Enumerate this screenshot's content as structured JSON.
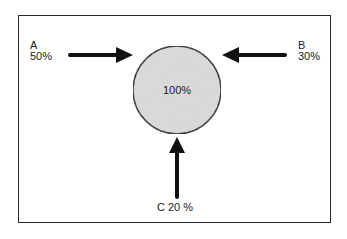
{
  "diagram": {
    "type": "flow-merge",
    "center": {
      "label": "100%",
      "fill": "#dcdcdc",
      "stroke": "#1a1a1a"
    },
    "inputs": [
      {
        "id": "A",
        "name": "A",
        "value": "50%",
        "direction": "from-left"
      },
      {
        "id": "B",
        "name": "B",
        "value": "30%",
        "direction": "from-right"
      },
      {
        "id": "C",
        "name": "C",
        "value": "20 %",
        "direction": "from-bottom",
        "combined_label": "C 20 %"
      }
    ],
    "colors": {
      "arrow": "#111111",
      "frame": "#2a2a2a",
      "text": "#1a1a1a",
      "background": "#ffffff"
    }
  }
}
